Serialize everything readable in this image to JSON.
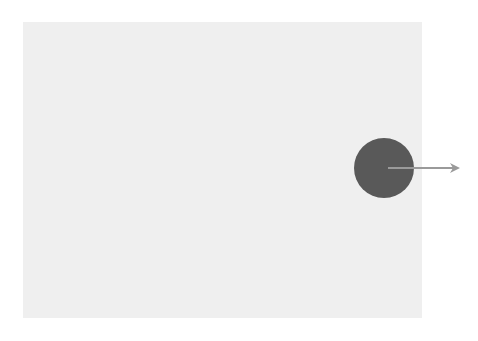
{
  "diagram": {
    "background_color": "#ffffff",
    "region": {
      "x": 23,
      "y": 22,
      "width": 399,
      "height": 296,
      "fill": "#efefef"
    },
    "ball": {
      "cx": 384,
      "cy": 168,
      "r": 30,
      "fill": "#595959"
    },
    "arrow": {
      "x1": 388,
      "y1": 168,
      "x2": 458,
      "y2": 168,
      "color": "#9a9a9a",
      "direction": "right"
    }
  }
}
